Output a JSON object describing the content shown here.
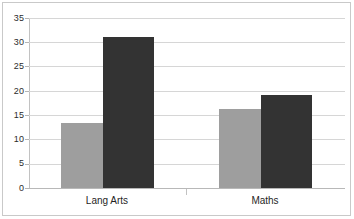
{
  "chart_data": {
    "type": "bar",
    "title": "",
    "subtitle": "",
    "xlabel": "",
    "ylabel": "",
    "categories": [
      "Lang Arts",
      "Maths"
    ],
    "series": [
      {
        "name": "Series 1",
        "color": "#9e9e9e",
        "values": [
          13.3,
          16.3
        ]
      },
      {
        "name": "Series 2",
        "color": "#333333",
        "values": [
          31.1,
          19.2
        ]
      }
    ],
    "ylim": [
      0,
      35
    ],
    "ytick_labels": [
      "0",
      "5",
      "10",
      "15",
      "20",
      "25",
      "30",
      "35"
    ],
    "ytick_values": [
      0,
      5,
      10,
      15,
      20,
      25,
      30,
      35
    ],
    "grid": true,
    "grid_axis": "y",
    "legend": false,
    "legend_position": "none",
    "annotations": [],
    "colors": {
      "series_1": "#9e9e9e",
      "series_2": "#333333",
      "gridline": "#d6d6d6",
      "axis": "#c2c2c2",
      "frame": "#c9c9c9",
      "background": "#ffffff",
      "tick_text": "#2b2b2b",
      "category_text": "#1f1f1f"
    }
  }
}
